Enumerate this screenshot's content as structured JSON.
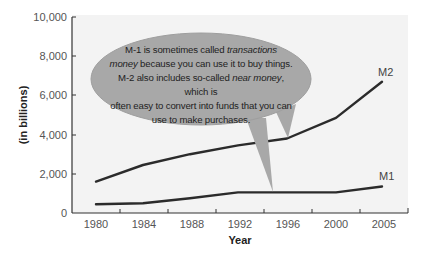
{
  "chart_data": {
    "type": "line",
    "title": "",
    "xlabel": "Year",
    "ylabel": "(in billions)",
    "ylim": [
      0,
      10000
    ],
    "yticks": [
      "0",
      "2,000",
      "4,000",
      "6,000",
      "8,000",
      "10,000"
    ],
    "categories": [
      "1980",
      "1984",
      "1988",
      "1992",
      "1996",
      "2000",
      "2005"
    ],
    "grid": false,
    "legend": "inline labels at line ends",
    "series": [
      {
        "name": "M2",
        "values": [
          1600,
          2450,
          3000,
          3450,
          3800,
          4850,
          6700
        ]
      },
      {
        "name": "M1",
        "values": [
          450,
          500,
          750,
          1050,
          1050,
          1050,
          1350
        ]
      }
    ],
    "annotation": {
      "line1_a": "M-1 is sometimes called ",
      "line1_b": "transactions",
      "line2_a": "money",
      "line2_b": " because you can use it to buy things.",
      "line3_a": "M-2 also includes so-called ",
      "line3_b": "near money",
      "line3_c": ", which is",
      "line4": "often easy to convert into funds that you can",
      "line5": "use to make purchases."
    }
  },
  "colors": {
    "plot_background": "#f3f3f3",
    "line": "#2b2b2b",
    "bubble_fill": "#a8a8a8",
    "bubble_edge": "#9a9a9a",
    "axis": "#333333"
  }
}
